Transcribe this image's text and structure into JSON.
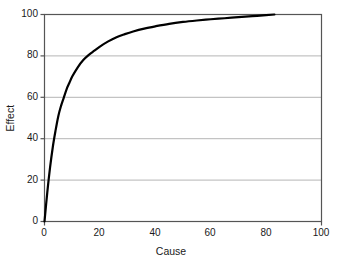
{
  "chart_data": {
    "type": "line",
    "title": "",
    "subtitle": "",
    "xlabel": "Cause",
    "ylabel": "Effect",
    "xlim": [
      0,
      100
    ],
    "ylim": [
      0,
      100
    ],
    "xticks": [
      0,
      20,
      40,
      60,
      80,
      100
    ],
    "yticks": [
      0,
      20,
      40,
      60,
      80,
      100
    ],
    "xtick_labels": [
      "0",
      "20",
      "40",
      "60",
      "80",
      "100"
    ],
    "ytick_labels": [
      "0",
      "20",
      "40",
      "60",
      "80",
      "100"
    ],
    "grid": {
      "horizontal": true,
      "vertical": false,
      "horizontal_at": [
        20,
        40,
        60,
        80
      ],
      "color": "#b5b5b5"
    },
    "legend": null,
    "legend_position": "none",
    "annotations": [],
    "series": [
      {
        "name": "Effect vs Cause",
        "color": "#000000",
        "line_width": 2.2,
        "x": [
          0,
          1,
          2,
          3,
          4,
          5,
          6,
          7,
          8,
          9,
          10,
          12,
          14,
          16,
          18,
          20,
          23,
          26,
          29,
          32,
          36,
          40,
          45,
          50,
          55,
          60,
          65,
          70,
          75,
          80,
          83
        ],
        "y": [
          0,
          14,
          26,
          36,
          44,
          51,
          56,
          60,
          64,
          67,
          70,
          74.5,
          78,
          80.5,
          82.5,
          84.5,
          87,
          89,
          90.5,
          91.8,
          93.2,
          94.3,
          95.5,
          96.4,
          97.1,
          97.7,
          98.2,
          98.7,
          99.2,
          99.7,
          100
        ]
      }
    ]
  },
  "axes": {
    "frame_color": "#555555",
    "x_axis_label": "Cause",
    "y_axis_label": "Effect"
  }
}
